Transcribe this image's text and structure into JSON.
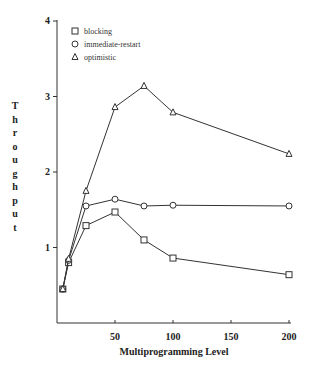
{
  "chart_data": {
    "type": "line",
    "title": "",
    "xlabel": "Multiprogramming Level",
    "ylabel": "Throughput",
    "x": [
      5,
      10,
      25,
      50,
      75,
      100,
      200
    ],
    "xlim": [
      0,
      200
    ],
    "ylim": [
      0,
      4
    ],
    "xticks": [
      50,
      100,
      150,
      200
    ],
    "yticks": [
      1,
      2,
      3,
      4
    ],
    "grid": false,
    "legend_position": "upper-left",
    "series": [
      {
        "name": "blocking",
        "marker": "square",
        "values": [
          0.45,
          0.8,
          1.29,
          1.47,
          1.1,
          0.86,
          0.64
        ]
      },
      {
        "name": "immediate-restart",
        "marker": "circle",
        "values": [
          0.45,
          0.83,
          1.55,
          1.64,
          1.55,
          1.56,
          1.55
        ]
      },
      {
        "name": "optimistic",
        "marker": "triangle",
        "values": [
          0.45,
          0.85,
          1.75,
          2.86,
          3.14,
          2.79,
          2.24
        ]
      }
    ]
  },
  "ylabel_letters": [
    "T",
    "h",
    "r",
    "o",
    "u",
    "g",
    "h",
    "p",
    "u",
    "t"
  ]
}
